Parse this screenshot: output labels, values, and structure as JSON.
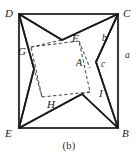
{
  "figure": {
    "caption": "(b)",
    "type": "geometric-diagram",
    "colors": {
      "stroke": "#1b1b1b",
      "outer_square_stroke": "#3a3a3a",
      "dashed_stroke": "#3d3d3d",
      "background": "#ffffff",
      "text": "#1b1b1b"
    },
    "outer_square": {
      "name": "DCBE",
      "vertices": [
        {
          "label": "D",
          "x": 19,
          "y": 14,
          "label_x": 6,
          "label_y": 8
        },
        {
          "label": "C",
          "x": 118,
          "y": 14,
          "label_x": 123,
          "label_y": 8
        },
        {
          "label": "B",
          "x": 118,
          "y": 128,
          "label_x": 122,
          "label_y": 130
        },
        {
          "label": "E",
          "x": 19,
          "y": 128,
          "label_x": 6,
          "label_y": 130
        }
      ]
    },
    "inner_square": {
      "name": "GFIH",
      "vertices": [
        {
          "label": "G",
          "x": 31,
          "y": 47,
          "label_x": 19,
          "label_y": 52
        },
        {
          "label": "F",
          "x": 79,
          "y": 41,
          "label_x": 73,
          "label_y": 37
        },
        {
          "label": "I",
          "x": 90,
          "y": 92,
          "label_x": 99,
          "label_y": 94
        },
        {
          "label": "H",
          "x": 42,
          "y": 97,
          "label_x": 48,
          "label_y": 103
        }
      ]
    },
    "area_labels": [
      {
        "label": "A",
        "x": 79,
        "y": 63
      },
      {
        "label": "b",
        "x": 104,
        "y": 39
      },
      {
        "label": "c",
        "x": 103,
        "y": 65
      },
      {
        "label": "a",
        "x": 126,
        "y": 56
      }
    ],
    "pinwheel_points": [
      {
        "name": "top-notch",
        "x": 62,
        "y": 40
      },
      {
        "name": "left-notch",
        "x": 34,
        "y": 69
      },
      {
        "name": "bottom-notch",
        "x": 82,
        "y": 94
      },
      {
        "name": "right-notch",
        "x": 96,
        "y": 62
      }
    ]
  }
}
